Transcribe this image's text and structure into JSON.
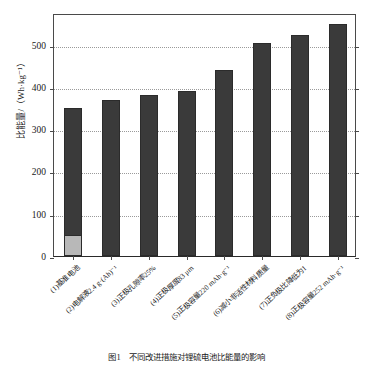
{
  "chart_data": {
    "type": "bar",
    "title": "",
    "xlabel": "",
    "ylabel": "比能量/（Wh·kg⁻¹）",
    "ylim": [
      0,
      575
    ],
    "ytick_values": [
      0,
      100,
      200,
      300,
      400,
      500
    ],
    "ytick_labels": [
      "0",
      "100",
      "200",
      "300",
      "400",
      "500"
    ],
    "grid": true,
    "legend": "none",
    "categories": [
      "(1)基准电池",
      "(2)电解液2.4 g·(Ah)⁻¹",
      "(3)正极孔隙率25%",
      "(4)正极厚度83 μm",
      "(5)正极容量220 mAh·g⁻¹",
      "(6)减小非活性材料质量",
      "(7)正负极比降低为1",
      "(8)正极容量252 mAh·g⁻¹"
    ],
    "values": [
      350,
      368,
      380,
      391,
      441,
      505,
      522,
      550
    ],
    "baseline_segment": {
      "category_index": 0,
      "value": 48,
      "color": "#b8b8b8"
    },
    "bar_color": "#3a3a3a",
    "bar_edge_color": "#2b2b2b",
    "axis_color": "#4a4a4a",
    "grid_color": "#9a9a9a"
  },
  "caption": "图1　不同改进措施对锂硫电池比能量的影响"
}
